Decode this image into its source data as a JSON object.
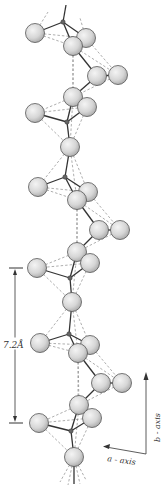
{
  "diagram": {
    "colors": {
      "sphere_fill": "#d9d9d9",
      "sphere_stroke": "#555555",
      "bond": "#333333",
      "dashed": "#777777",
      "text": "#333333"
    },
    "scale_bar": {
      "label": "7.2Å",
      "top_y": 268,
      "bottom_y": 423,
      "x": 15
    },
    "axes": {
      "b_axis_label": "b - axis",
      "a_axis_label": "a - axis"
    },
    "repeat_units": [
      {
        "spheres": [
          [
            35,
            33
          ],
          [
            86,
            38
          ],
          [
            73,
            46
          ],
          [
            97,
            76
          ],
          [
            118,
            75
          ],
          [
            73,
            97
          ],
          [
            87,
            107
          ],
          [
            35,
            113
          ],
          [
            70,
            147
          ]
        ],
        "small_atoms": [
          [
            63,
            22
          ],
          [
            67,
            122
          ]
        ]
      },
      {
        "spheres": [
          [
            38,
            187
          ],
          [
            88,
            192
          ],
          [
            77,
            200
          ],
          [
            99,
            230
          ],
          [
            120,
            230
          ],
          [
            77,
            252
          ],
          [
            90,
            263
          ],
          [
            37,
            268
          ],
          [
            72,
            302
          ]
        ],
        "small_atoms": [
          [
            65,
            177
          ],
          [
            70,
            278
          ]
        ]
      },
      {
        "spheres": [
          [
            40,
            343
          ],
          [
            90,
            345
          ],
          [
            78,
            353
          ],
          [
            101,
            383
          ],
          [
            122,
            383
          ],
          [
            79,
            405
          ],
          [
            92,
            418
          ],
          [
            39,
            423
          ],
          [
            74,
            457
          ]
        ],
        "small_atoms": [
          [
            69,
            334
          ],
          [
            71,
            431
          ]
        ]
      }
    ]
  }
}
